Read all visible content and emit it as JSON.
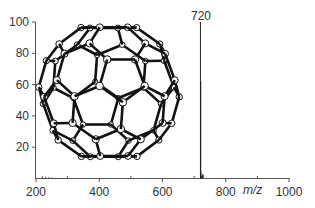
{
  "chart_data": {
    "type": "bar",
    "title": "",
    "xlabel": "m/z",
    "ylabel": "",
    "xlim": [
      200,
      1000
    ],
    "ylim": [
      0,
      100
    ],
    "x_ticks": [
      200,
      400,
      600,
      800,
      1000
    ],
    "x_minor_ticks": [
      300,
      500,
      700,
      900
    ],
    "y_ticks": [
      20,
      40,
      60,
      80,
      100
    ],
    "grid": false,
    "legend": null,
    "series": [
      {
        "name": "mass spectrum",
        "points": [
          {
            "x": 220,
            "y": 1.5
          },
          {
            "x": 230,
            "y": 1.0
          },
          {
            "x": 240,
            "y": 0.8
          },
          {
            "x": 250,
            "y": 0.6
          },
          {
            "x": 260,
            "y": 0.5
          },
          {
            "x": 270,
            "y": 0.4
          },
          {
            "x": 280,
            "y": 0.3
          },
          {
            "x": 720,
            "y": 100
          },
          {
            "x": 721,
            "y": 62
          },
          {
            "x": 722,
            "y": 4
          },
          {
            "x": 723,
            "y": 1.5
          }
        ]
      }
    ],
    "annotations": [
      {
        "text": "720",
        "x": 720,
        "y": 100,
        "position": "above peak"
      },
      {
        "text": "C60 fullerene (buckminsterfullerene) molecular structure illustration",
        "type": "inset-image"
      }
    ]
  },
  "labels": {
    "x_axis_title": "m/z",
    "peak_label": "720",
    "x_tick_labels": [
      "200",
      "400",
      "600",
      "800",
      "1000"
    ],
    "y_tick_labels": [
      "20",
      "40",
      "60",
      "80",
      "100"
    ]
  },
  "colors": {
    "axis": "#555555",
    "peak": "#222222",
    "molecule_bond": "#111111",
    "molecule_atom_fill": "#ffffff"
  }
}
